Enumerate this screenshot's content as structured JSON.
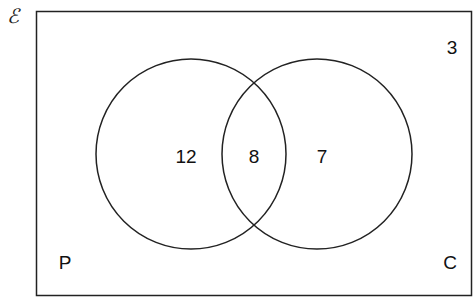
{
  "diagram": {
    "type": "venn",
    "universal_set": {
      "symbol": "ℰ",
      "outside_count": "3"
    },
    "sets": [
      {
        "name": "P",
        "only_count": "12"
      },
      {
        "name": "C",
        "only_count": "7"
      }
    ],
    "intersection": {
      "sets": [
        "P",
        "C"
      ],
      "count": "8"
    },
    "labels": {
      "set_p": "P",
      "set_c": "C"
    },
    "colors": {
      "stroke": "#222222",
      "background": "#ffffff",
      "text": "#111111"
    }
  }
}
